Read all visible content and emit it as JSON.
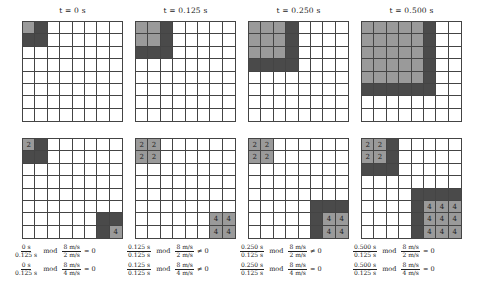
{
  "colors": {
    "light": "#9a9a9a",
    "dark": "#4a4a4a",
    "empty": "#ffffff",
    "grid_line": "#444444"
  },
  "grid_size": 8,
  "panels": [
    {
      "title": "t = 0 s",
      "top_grid": {
        "light": [
          [
            0,
            0
          ]
        ],
        "dark": [
          [
            0,
            1
          ],
          [
            1,
            0
          ],
          [
            1,
            1
          ]
        ]
      },
      "bottom_grid": {
        "light": [
          [
            0,
            0,
            "2"
          ],
          [
            7,
            7,
            "4"
          ]
        ],
        "dark": [
          [
            0,
            1
          ],
          [
            1,
            0
          ],
          [
            1,
            1
          ],
          [
            6,
            6
          ],
          [
            6,
            7
          ],
          [
            7,
            6
          ]
        ]
      },
      "equations": [
        {
          "num": "0 s",
          "den": "0.125 s",
          "mod": "mod",
          "mnum": "8 m/s",
          "mden": "2 m/s",
          "rel": "= 0"
        },
        {
          "num": "0 s",
          "den": "0.125 s",
          "mod": "mod",
          "mnum": "8 m/s",
          "mden": "4 m/s",
          "rel": "= 0"
        }
      ]
    },
    {
      "title": "t = 0.125 s",
      "top_grid": {
        "light": [
          [
            0,
            0
          ],
          [
            0,
            1
          ],
          [
            1,
            0
          ],
          [
            1,
            1
          ]
        ],
        "dark": [
          [
            0,
            2
          ],
          [
            1,
            2
          ],
          [
            2,
            0
          ],
          [
            2,
            1
          ],
          [
            2,
            2
          ]
        ]
      },
      "bottom_grid": {
        "light": [
          [
            0,
            0,
            "2"
          ],
          [
            0,
            1,
            "2"
          ],
          [
            1,
            0,
            "2"
          ],
          [
            1,
            1,
            "2"
          ],
          [
            6,
            6,
            "4"
          ],
          [
            6,
            7,
            "4"
          ],
          [
            7,
            6,
            "4"
          ],
          [
            7,
            7,
            "4"
          ]
        ],
        "dark": []
      },
      "equations": [
        {
          "num": "0.125 s",
          "den": "0.125 s",
          "mod": "mod",
          "mnum": "8 m/s",
          "mden": "2 m/s",
          "rel": "≠ 0"
        },
        {
          "num": "0.125 s",
          "den": "0.125 s",
          "mod": "mod",
          "mnum": "8 m/s",
          "mden": "4 m/s",
          "rel": "≠ 0"
        }
      ]
    },
    {
      "title": "t = 0.250 s",
      "top_grid": {
        "light": [
          [
            0,
            0
          ],
          [
            0,
            1
          ],
          [
            0,
            2
          ],
          [
            1,
            0
          ],
          [
            1,
            1
          ],
          [
            1,
            2
          ],
          [
            2,
            0
          ],
          [
            2,
            1
          ],
          [
            2,
            2
          ]
        ],
        "dark": [
          [
            0,
            3
          ],
          [
            1,
            3
          ],
          [
            2,
            3
          ],
          [
            3,
            0
          ],
          [
            3,
            1
          ],
          [
            3,
            2
          ],
          [
            3,
            3
          ]
        ]
      },
      "bottom_grid": {
        "light": [
          [
            0,
            0,
            "2"
          ],
          [
            0,
            1,
            "2"
          ],
          [
            1,
            0,
            "2"
          ],
          [
            1,
            1,
            "2"
          ],
          [
            6,
            6,
            "4"
          ],
          [
            6,
            7,
            "4"
          ],
          [
            7,
            6,
            "4"
          ],
          [
            7,
            7,
            "4"
          ]
        ],
        "dark": [
          [
            5,
            5
          ],
          [
            5,
            6
          ],
          [
            5,
            7
          ],
          [
            6,
            5
          ],
          [
            7,
            5
          ]
        ]
      },
      "equations": [
        {
          "num": "0.250 s",
          "den": "0.125 s",
          "mod": "mod",
          "mnum": "8 m/s",
          "mden": "2 m/s",
          "rel": "≠ 0"
        },
        {
          "num": "0.250 s",
          "den": "0.125 s",
          "mod": "mod",
          "mnum": "8 m/s",
          "mden": "4 m/s",
          "rel": "= 0"
        }
      ]
    },
    {
      "title": "t = 0.500 s",
      "top_grid": {
        "light": [
          [
            0,
            0
          ],
          [
            0,
            1
          ],
          [
            0,
            2
          ],
          [
            0,
            3
          ],
          [
            0,
            4
          ],
          [
            1,
            0
          ],
          [
            1,
            1
          ],
          [
            1,
            2
          ],
          [
            1,
            3
          ],
          [
            1,
            4
          ],
          [
            2,
            0
          ],
          [
            2,
            1
          ],
          [
            2,
            2
          ],
          [
            2,
            3
          ],
          [
            2,
            4
          ],
          [
            3,
            0
          ],
          [
            3,
            1
          ],
          [
            3,
            2
          ],
          [
            3,
            3
          ],
          [
            3,
            4
          ],
          [
            4,
            0
          ],
          [
            4,
            1
          ],
          [
            4,
            2
          ],
          [
            4,
            3
          ],
          [
            4,
            4
          ]
        ],
        "dark": [
          [
            0,
            5
          ],
          [
            1,
            5
          ],
          [
            2,
            5
          ],
          [
            3,
            5
          ],
          [
            4,
            5
          ],
          [
            5,
            0
          ],
          [
            5,
            1
          ],
          [
            5,
            2
          ],
          [
            5,
            3
          ],
          [
            5,
            4
          ],
          [
            5,
            5
          ]
        ]
      },
      "bottom_grid": {
        "light": [
          [
            0,
            0,
            "2"
          ],
          [
            0,
            1,
            "2"
          ],
          [
            1,
            0,
            "2"
          ],
          [
            1,
            1,
            "2"
          ],
          [
            5,
            5,
            "4"
          ],
          [
            5,
            6,
            "4"
          ],
          [
            5,
            7,
            "4"
          ],
          [
            6,
            5,
            "4"
          ],
          [
            6,
            6,
            "4"
          ],
          [
            6,
            7,
            "4"
          ],
          [
            7,
            5,
            "4"
          ],
          [
            7,
            6,
            "4"
          ],
          [
            7,
            7,
            "4"
          ]
        ],
        "dark": [
          [
            0,
            2
          ],
          [
            1,
            2
          ],
          [
            2,
            0
          ],
          [
            2,
            1
          ],
          [
            2,
            2
          ],
          [
            4,
            4
          ],
          [
            4,
            5
          ],
          [
            4,
            6
          ],
          [
            4,
            7
          ],
          [
            5,
            4
          ],
          [
            6,
            4
          ],
          [
            7,
            4
          ]
        ]
      },
      "equations": [
        {
          "num": "0.500 s",
          "den": "0.125 s",
          "mod": "mod",
          "mnum": "8 m/s",
          "mden": "2 m/s",
          "rel": "= 0"
        },
        {
          "num": "0.500 s",
          "den": "0.125 s",
          "mod": "mod",
          "mnum": "8 m/s",
          "mden": "4 m/s",
          "rel": "= 0"
        }
      ]
    }
  ]
}
